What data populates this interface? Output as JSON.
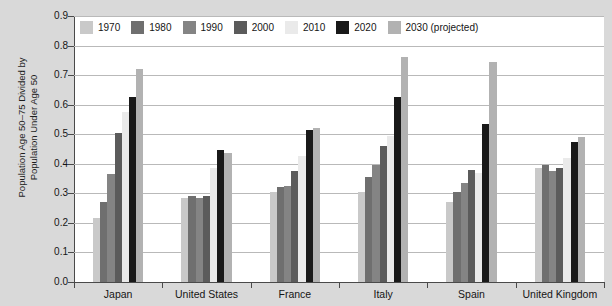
{
  "chart_data": {
    "type": "bar",
    "title": "",
    "xlabel": "",
    "ylabel": "Population Age 50–75 Divided by\nPopulation Under Age 50",
    "ylim": [
      0.0,
      0.9
    ],
    "ytick_labels": [
      "0.0",
      "0.1",
      "0.2",
      "0.3",
      "0.4",
      "0.5",
      "0.6",
      "0.7",
      "0.8",
      "0.9"
    ],
    "ytick_values": [
      0.0,
      0.1,
      0.2,
      0.3,
      0.4,
      0.5,
      0.6,
      0.7,
      0.8,
      0.9
    ],
    "grid": true,
    "legend_position": "top-inside",
    "categories": [
      "Japan",
      "United States",
      "France",
      "Italy",
      "Spain",
      "United Kingdom"
    ],
    "series": [
      {
        "name": "1970",
        "color": "#c9c9c9",
        "values": [
          0.215,
          0.285,
          0.305,
          0.305,
          0.27,
          0.385
        ]
      },
      {
        "name": "1980",
        "color": "#6f6f6f",
        "values": [
          0.27,
          0.29,
          0.32,
          0.355,
          0.305,
          0.395
        ]
      },
      {
        "name": "1990",
        "color": "#848484",
        "values": [
          0.365,
          0.285,
          0.325,
          0.395,
          0.335,
          0.375
        ]
      },
      {
        "name": "2000",
        "color": "#5b5b5b",
        "values": [
          0.505,
          0.29,
          0.375,
          0.46,
          0.38,
          0.385
        ]
      },
      {
        "name": "2010",
        "color": "#eaeaea",
        "values": [
          0.575,
          0.385,
          0.425,
          0.495,
          0.37,
          0.42
        ]
      },
      {
        "name": "2020",
        "color": "#191919",
        "values": [
          0.625,
          0.445,
          0.515,
          0.625,
          0.535,
          0.475
        ]
      },
      {
        "name": "2030 (projected)",
        "color": "#b2b2b2",
        "values": [
          0.72,
          0.435,
          0.52,
          0.76,
          0.745,
          0.49
        ]
      }
    ]
  },
  "colors": {
    "plot_background": "#ffffff",
    "page_background": "#d9d9d9",
    "gridline": "#b9b9b9",
    "axis": "#4a4a4a",
    "text": "#151515"
  }
}
